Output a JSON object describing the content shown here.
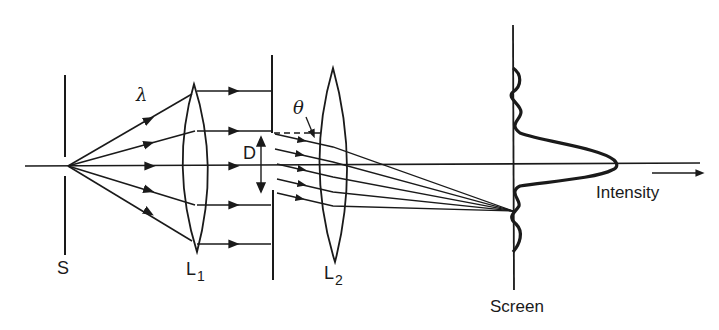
{
  "diagram": {
    "colors": {
      "ink": "#1a1a1a",
      "background": "#ffffff"
    },
    "labels": {
      "source": "S",
      "wavelength": "λ",
      "lens1_main": "L",
      "lens1_sub": "1",
      "slit_width": "D",
      "angle": "θ",
      "lens2_main": "L",
      "lens2_sub": "2",
      "screen": "Screen",
      "intensity": "Intensity"
    },
    "components": [
      {
        "id": "source-slit",
        "label": "S"
      },
      {
        "id": "collimating-lens",
        "label": "L1"
      },
      {
        "id": "aperture",
        "label": "D"
      },
      {
        "id": "focusing-lens",
        "label": "L2"
      },
      {
        "id": "screen",
        "label": "Screen"
      }
    ],
    "intensity_profile": "central maximum with secondary side lobes"
  }
}
